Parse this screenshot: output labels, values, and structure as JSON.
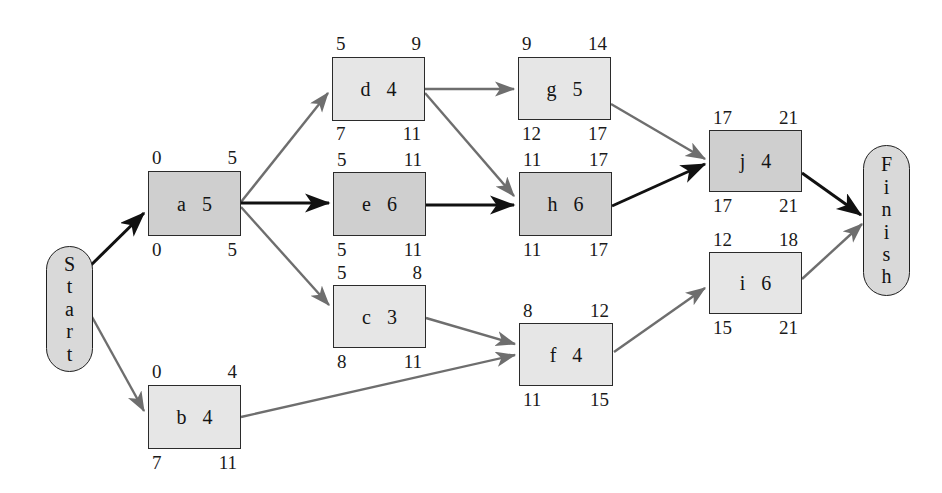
{
  "diagram": {
    "type": "activity-on-node-network",
    "colors": {
      "node_fill_normal": "#e6e6e6",
      "node_fill_critical": "#cfcfcf",
      "node_border": "#2b2b2b",
      "edge_normal": "#6e6e6e",
      "edge_critical": "#111111",
      "terminal_fill": "#d9d9d9",
      "background": "#ffffff"
    },
    "terminals": [
      {
        "id": "start",
        "label": "Start",
        "letters": [
          "S",
          "t",
          "a",
          "r",
          "t"
        ]
      },
      {
        "id": "finish",
        "label": "Finish",
        "letters": [
          "F",
          "i",
          "n",
          "i",
          "s",
          "h"
        ]
      }
    ],
    "nodes": [
      {
        "id": "a",
        "name": "a",
        "duration": "5",
        "early_start": "0",
        "early_finish": "5",
        "late_start": "0",
        "late_finish": "5",
        "critical": true
      },
      {
        "id": "b",
        "name": "b",
        "duration": "4",
        "early_start": "0",
        "early_finish": "4",
        "late_start": "7",
        "late_finish": "11",
        "critical": false
      },
      {
        "id": "c",
        "name": "c",
        "duration": "3",
        "early_start": "5",
        "early_finish": "8",
        "late_start": "8",
        "late_finish": "11",
        "critical": false
      },
      {
        "id": "d",
        "name": "d",
        "duration": "4",
        "early_start": "5",
        "early_finish": "9",
        "late_start": "7",
        "late_finish": "11",
        "critical": false
      },
      {
        "id": "e",
        "name": "e",
        "duration": "6",
        "early_start": "5",
        "early_finish": "11",
        "late_start": "5",
        "late_finish": "11",
        "critical": true
      },
      {
        "id": "f",
        "name": "f",
        "duration": "4",
        "early_start": "8",
        "early_finish": "12",
        "late_start": "11",
        "late_finish": "15",
        "critical": false
      },
      {
        "id": "g",
        "name": "g",
        "duration": "5",
        "early_start": "9",
        "early_finish": "14",
        "late_start": "12",
        "late_finish": "17",
        "critical": false
      },
      {
        "id": "h",
        "name": "h",
        "duration": "6",
        "early_start": "11",
        "early_finish": "17",
        "late_start": "11",
        "late_finish": "17",
        "critical": true
      },
      {
        "id": "i",
        "name": "i",
        "duration": "6",
        "early_start": "12",
        "early_finish": "18",
        "late_start": "15",
        "late_finish": "21",
        "critical": false
      },
      {
        "id": "j",
        "name": "j",
        "duration": "4",
        "early_start": "17",
        "early_finish": "21",
        "late_start": "17",
        "late_finish": "21",
        "critical": true
      }
    ],
    "edges": [
      {
        "from": "start",
        "to": "a",
        "critical": true
      },
      {
        "from": "start",
        "to": "b",
        "critical": false
      },
      {
        "from": "a",
        "to": "d",
        "critical": false
      },
      {
        "from": "a",
        "to": "e",
        "critical": true
      },
      {
        "from": "a",
        "to": "c",
        "critical": false
      },
      {
        "from": "d",
        "to": "g",
        "critical": false
      },
      {
        "from": "d",
        "to": "h",
        "critical": false
      },
      {
        "from": "e",
        "to": "h",
        "critical": true
      },
      {
        "from": "c",
        "to": "f",
        "critical": false
      },
      {
        "from": "b",
        "to": "f",
        "critical": false
      },
      {
        "from": "g",
        "to": "j",
        "critical": false
      },
      {
        "from": "h",
        "to": "j",
        "critical": true
      },
      {
        "from": "f",
        "to": "i",
        "critical": false
      },
      {
        "from": "i",
        "to": "finish",
        "critical": false
      },
      {
        "from": "j",
        "to": "finish",
        "critical": true
      }
    ],
    "critical_path": [
      "Start",
      "a",
      "e",
      "h",
      "j",
      "Finish"
    ],
    "project_duration": "21"
  }
}
